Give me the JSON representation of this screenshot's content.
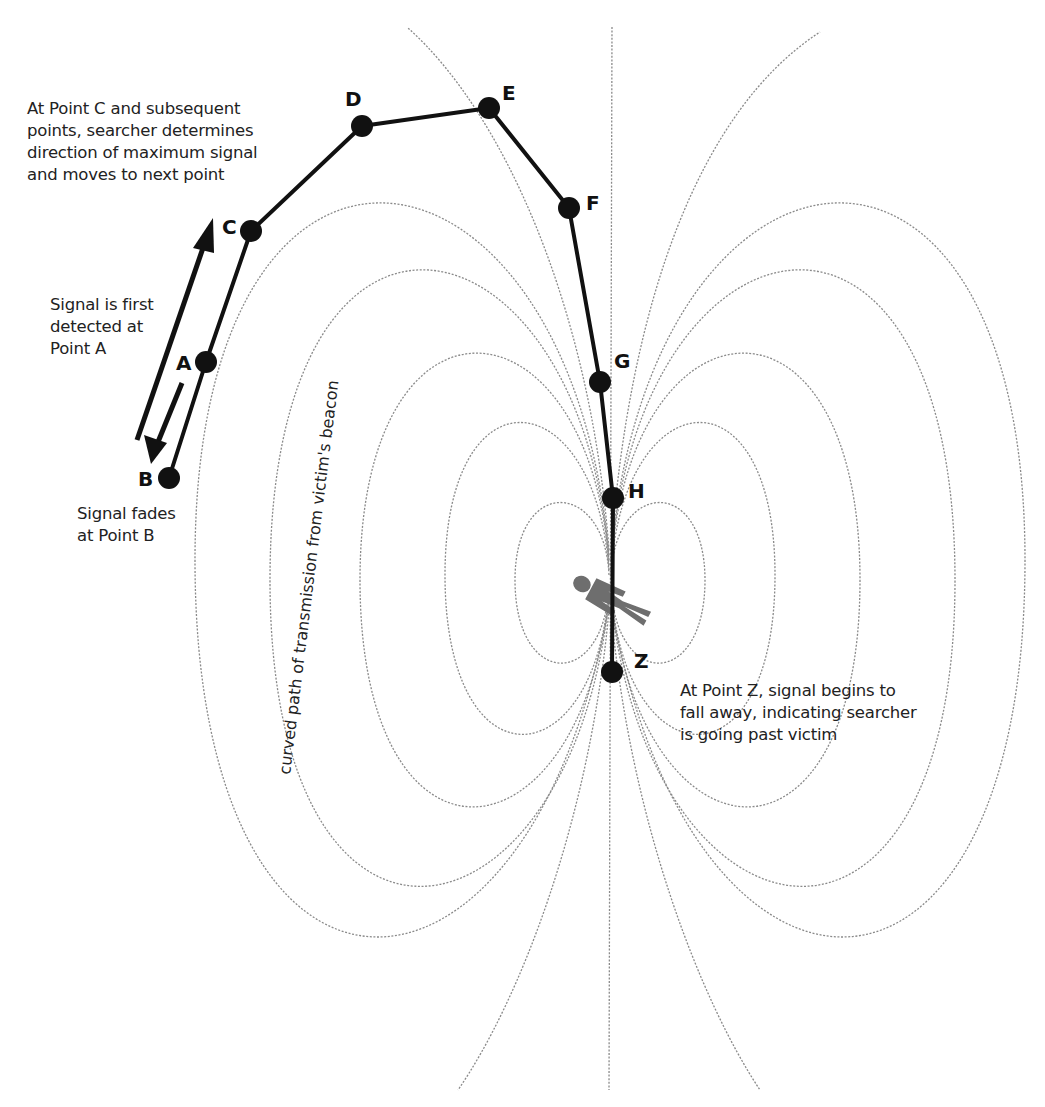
{
  "diagram": {
    "points": [
      {
        "id": "A",
        "label": "A",
        "x": 206,
        "y": 362
      },
      {
        "id": "B",
        "label": "B",
        "x": 169,
        "y": 478
      },
      {
        "id": "C",
        "label": "C",
        "x": 251,
        "y": 231
      },
      {
        "id": "D",
        "label": "D",
        "x": 362,
        "y": 126
      },
      {
        "id": "E",
        "label": "E",
        "x": 489,
        "y": 108
      },
      {
        "id": "F",
        "label": "F",
        "x": 569,
        "y": 208
      },
      {
        "id": "G",
        "label": "G",
        "x": 600,
        "y": 382
      },
      {
        "id": "H",
        "label": "H",
        "x": 613,
        "y": 498
      },
      {
        "id": "Z",
        "label": "Z",
        "x": 612,
        "y": 672
      }
    ],
    "search_path_order": [
      "B",
      "A",
      "C",
      "D",
      "E",
      "F",
      "G",
      "H",
      "Z"
    ],
    "annotations": {
      "point_c": "At Point C and subsequent\npoints, searcher determines\ndirection of maximum signal\nand moves to next point",
      "point_a": "Signal is first\ndetected at\nPoint A",
      "point_b": "Signal fades\nat Point B",
      "point_z": "At Point Z, signal begins to\nfall away, indicating searcher\nis going past victim",
      "curve_caption": "curved path of transmission from victim's beacon"
    },
    "icons": {
      "victim": "person-silhouette-icon",
      "arrow_up": "arrow-up-right-icon",
      "arrow_down": "arrow-down-left-icon"
    },
    "colors": {
      "path": "#111111",
      "field_lines": "#8a8a8a",
      "victim": "#6e6e6e",
      "text": "#222222",
      "background": "#ffffff"
    }
  }
}
